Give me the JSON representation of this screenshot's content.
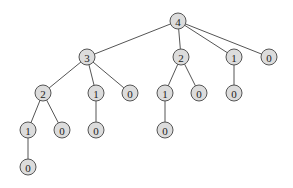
{
  "diagram": {
    "type": "tree",
    "node_radius": 8,
    "colors": {
      "node_fill": "#dcdcdc",
      "node_stroke": "#555555",
      "edge": "#555555",
      "label": "#222222"
    },
    "nodes": [
      {
        "id": "n0",
        "label": "4",
        "x": 178,
        "y": 21
      },
      {
        "id": "n1",
        "label": "3",
        "x": 87,
        "y": 57
      },
      {
        "id": "n2",
        "label": "2",
        "x": 181,
        "y": 57
      },
      {
        "id": "n3",
        "label": "1",
        "x": 234,
        "y": 57
      },
      {
        "id": "n4",
        "label": "0",
        "x": 269,
        "y": 57
      },
      {
        "id": "n5",
        "label": "2",
        "x": 43,
        "y": 93
      },
      {
        "id": "n6",
        "label": "1",
        "x": 96,
        "y": 93
      },
      {
        "id": "n7",
        "label": "0",
        "x": 130,
        "y": 93
      },
      {
        "id": "n8",
        "label": "1",
        "x": 165,
        "y": 93
      },
      {
        "id": "n9",
        "label": "0",
        "x": 199,
        "y": 93
      },
      {
        "id": "n10",
        "label": "0",
        "x": 234,
        "y": 93
      },
      {
        "id": "n11",
        "label": "1",
        "x": 28,
        "y": 130
      },
      {
        "id": "n12",
        "label": "0",
        "x": 62,
        "y": 130
      },
      {
        "id": "n13",
        "label": "0",
        "x": 96,
        "y": 130
      },
      {
        "id": "n14",
        "label": "0",
        "x": 165,
        "y": 130
      },
      {
        "id": "n15",
        "label": "0",
        "x": 28,
        "y": 167
      }
    ],
    "edges": [
      [
        "n0",
        "n1"
      ],
      [
        "n0",
        "n2"
      ],
      [
        "n0",
        "n3"
      ],
      [
        "n0",
        "n4"
      ],
      [
        "n1",
        "n5"
      ],
      [
        "n1",
        "n6"
      ],
      [
        "n1",
        "n7"
      ],
      [
        "n2",
        "n8"
      ],
      [
        "n2",
        "n9"
      ],
      [
        "n3",
        "n10"
      ],
      [
        "n5",
        "n11"
      ],
      [
        "n5",
        "n12"
      ],
      [
        "n6",
        "n13"
      ],
      [
        "n8",
        "n14"
      ],
      [
        "n11",
        "n15"
      ]
    ]
  }
}
